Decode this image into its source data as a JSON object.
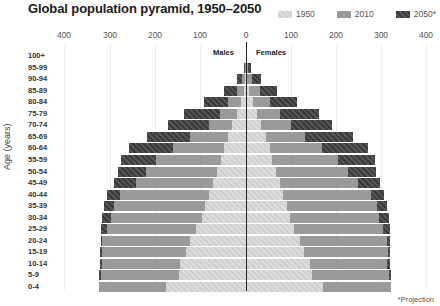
{
  "title": "Global population pyramid, 1950–2050",
  "legend": [
    {
      "label": "1950",
      "color": "#d4d4d4"
    },
    {
      "label": "2010",
      "color": "#9a9a9a"
    },
    {
      "label": "2050*",
      "color": "#444444"
    }
  ],
  "axis": {
    "ticks_left": [
      "400",
      "300",
      "200",
      "100"
    ],
    "tick_center": "0",
    "ticks_right": [
      "100",
      "200",
      "300",
      "400"
    ]
  },
  "labels": {
    "males": "Males",
    "females": "Females",
    "ylabel": "Age (years)",
    "footnote": "*Projection"
  },
  "chart_data": {
    "type": "bar",
    "subtype": "population-pyramid",
    "title": "Global population pyramid, 1950–2050",
    "xlabel": "",
    "ylabel": "Age (years)",
    "xlim": [
      -400,
      400
    ],
    "x_ticks": [
      400,
      300,
      200,
      100,
      0,
      100,
      200,
      300,
      400
    ],
    "grid": true,
    "legend_position": "top-right",
    "footnote": "*Projection",
    "categories": [
      "100+",
      "95-99",
      "90-94",
      "85-89",
      "80-84",
      "75-79",
      "70-74",
      "65-69",
      "60-64",
      "55-59",
      "50-54",
      "45-49",
      "40-44",
      "35-39",
      "30-34",
      "25-29",
      "20-24",
      "15-19",
      "10-14",
      "5-9",
      "0-4"
    ],
    "series": [
      {
        "name": "1950",
        "sex": "Males",
        "values": [
          0,
          0,
          2,
          5,
          12,
          20,
          30,
          40,
          48,
          56,
          64,
          72,
          82,
          90,
          96,
          110,
          122,
          132,
          145,
          148,
          176
        ]
      },
      {
        "name": "2010",
        "sex": "Males",
        "values": [
          0,
          2,
          8,
          20,
          40,
          58,
          82,
          122,
          160,
          197,
          220,
          242,
          277,
          291,
          297,
          306,
          316,
          317,
          316,
          318,
          324
        ]
      },
      {
        "name": "2050*",
        "sex": "Males",
        "values": [
          1,
          5,
          20,
          48,
          92,
          136,
          171,
          218,
          257,
          275,
          281,
          290,
          305,
          312,
          316,
          319,
          319,
          320,
          320,
          322,
          322
        ]
      },
      {
        "name": "1950",
        "sex": "Females",
        "values": [
          0,
          0,
          3,
          7,
          15,
          24,
          34,
          44,
          52,
          58,
          66,
          74,
          82,
          90,
          96,
          106,
          118,
          128,
          140,
          146,
          170
        ]
      },
      {
        "name": "2010",
        "sex": "Females",
        "values": [
          0,
          4,
          14,
          30,
          52,
          74,
          98,
          130,
          168,
          202,
          224,
          246,
          274,
          288,
          292,
          302,
          310,
          312,
          310,
          314,
          318
        ]
      },
      {
        "name": "2050*",
        "sex": "Females",
        "values": [
          2,
          10,
          34,
          68,
          112,
          160,
          190,
          236,
          268,
          284,
          286,
          294,
          304,
          310,
          314,
          316,
          316,
          316,
          316,
          318,
          316
        ]
      }
    ]
  }
}
